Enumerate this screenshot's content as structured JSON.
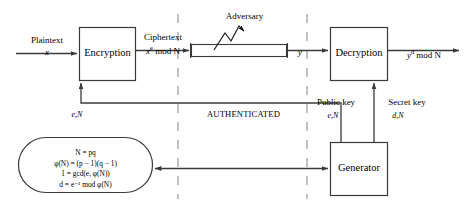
{
  "diagram": {
    "title_alt": "RSA public-key cryptosystem block diagram",
    "colors": {
      "stroke": "#3a3a3a",
      "text": "#000000",
      "background": "#ffffff",
      "dashed": "#8a8a8a"
    },
    "blocks": [
      {
        "id": "encryption",
        "label": "Encryption"
      },
      {
        "id": "decryption",
        "label": "Decryption"
      },
      {
        "id": "generator",
        "label": "Generator"
      },
      {
        "id": "channel",
        "label": ""
      }
    ],
    "labels": {
      "plaintext": "Plaintext",
      "plaintext_var": "x",
      "ciphertext": "Ciphertext",
      "ciphertext_expr_base": "x",
      "ciphertext_expr_exp": "e",
      "ciphertext_expr_rest": "mod N",
      "channel_output": "y",
      "decrypted_base": "y",
      "decrypted_exp": "d",
      "decrypted_rest": "mod N",
      "adversary": "Adversary",
      "authenticated": "AUTHENTICATED",
      "public_key": "Public key",
      "public_key_value": "e,N",
      "secret_key": "Secret key",
      "secret_key_value": "d,N",
      "encryption_key_value": "e,N"
    },
    "equations": [
      {
        "lhs": "N",
        "rel": "=",
        "rhs": "pq",
        "full": "N = pq"
      },
      {
        "lhs": "φ(N)",
        "rel": "=",
        "rhs": "(p − 1)(q − 1)",
        "full": "φ(N) = (p − 1)(q − 1)"
      },
      {
        "lhs": "1",
        "rel": "=",
        "rhs": "gcd(e, φ(N))",
        "full": "1 = gcd(e, φ(N))"
      },
      {
        "lhs": "d",
        "rel": "=",
        "rhs": "e⁻¹ mod φ(N)",
        "full": "d = e⁻¹ mod φ(N)"
      }
    ]
  }
}
